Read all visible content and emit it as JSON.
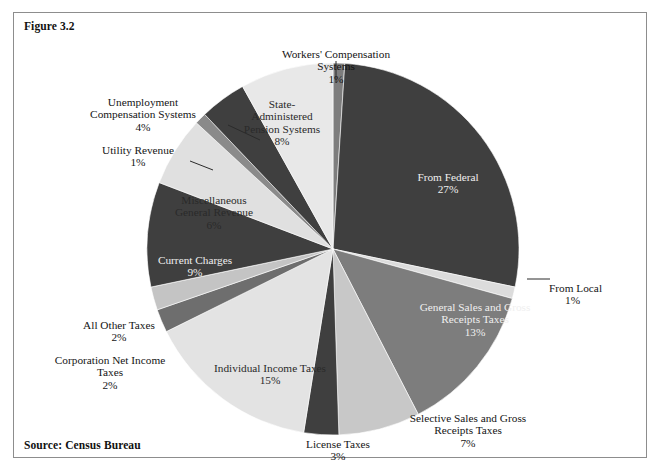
{
  "figure": {
    "caption": "Figure 3.2",
    "source": "Source: Census Bureau"
  },
  "chart_data": {
    "type": "pie",
    "title": "Figure 3.2",
    "subtitle": "",
    "xlabel": "",
    "ylabel": "",
    "grid": false,
    "legend_position": "none",
    "label_format": "name + percent",
    "start_angle_deg": 0,
    "direction": "clockwise",
    "units": "percent",
    "total_percent": 99,
    "slices": [
      {
        "label": "Workers' Compensation Systems",
        "value": 1,
        "pct_text": "1%",
        "color": "#7d7d7d"
      },
      {
        "label": "From Federal",
        "value": 27,
        "pct_text": "27%",
        "color": "#3f3f3f"
      },
      {
        "label": "From Local",
        "value": 1,
        "pct_text": "1%",
        "color": "#dcdcdc"
      },
      {
        "label": "General Sales and Gross Receipts Taxes",
        "value": 13,
        "pct_text": "13%",
        "color": "#7d7d7d"
      },
      {
        "label": "Selective Sales and Gross Receipts Taxes",
        "value": 7,
        "pct_text": "7%",
        "color": "#c8c8c8"
      },
      {
        "label": "License Taxes",
        "value": 3,
        "pct_text": "3%",
        "color": "#3f3f3f"
      },
      {
        "label": "Individual Income Taxes",
        "value": 15,
        "pct_text": "15%",
        "color": "#e3e3e3"
      },
      {
        "label": "Corporation Net Income Taxes",
        "value": 2,
        "pct_text": "2%",
        "color": "#6e6e6e"
      },
      {
        "label": "All Other Taxes",
        "value": 2,
        "pct_text": "2%",
        "color": "#c4c4c4"
      },
      {
        "label": "Current Charges",
        "value": 9,
        "pct_text": "9%",
        "color": "#3f3f3f"
      },
      {
        "label": "Miscellaneous General Revenue",
        "value": 6,
        "pct_text": "6%",
        "color": "#e0e0e0"
      },
      {
        "label": "Utility Revenue",
        "value": 1,
        "pct_text": "1%",
        "color": "#8a8a8a"
      },
      {
        "label": "Unemployment Compensation Systems",
        "value": 4,
        "pct_text": "4%",
        "color": "#3f3f3f"
      },
      {
        "label": "State-Administered Pension Systems",
        "value": 8,
        "pct_text": "8%",
        "color": "#e8e8e8"
      }
    ]
  },
  "labels": {
    "workers_comp": {
      "name": "Workers' Compensation\nSystems",
      "pct": "1%"
    },
    "from_federal": {
      "name": "From Federal",
      "pct": "27%"
    },
    "from_local": {
      "name": "From Local",
      "pct": "1%"
    },
    "general_sales": {
      "name": "General Sales and Gross\nReceipts Taxes",
      "pct": "13%"
    },
    "selective_sales": {
      "name": "Selective Sales and Gross\nReceipts Taxes",
      "pct": "7%"
    },
    "license_taxes": {
      "name": "License Taxes",
      "pct": "3%"
    },
    "individual_income": {
      "name": "Individual Income Taxes",
      "pct": "15%"
    },
    "corporation_net": {
      "name": "Corporation Net Income\nTaxes",
      "pct": "2%"
    },
    "all_other_taxes": {
      "name": "All Other Taxes",
      "pct": "2%"
    },
    "current_charges": {
      "name": "Current Charges",
      "pct": "9%"
    },
    "misc_general": {
      "name": "Miscellaneous\nGeneral Revenue",
      "pct": "6%"
    },
    "utility_revenue": {
      "name": "Utility Revenue",
      "pct": "1%"
    },
    "unemployment_comp": {
      "name": "Unemployment\nCompensation Systems",
      "pct": "4%"
    },
    "state_pension": {
      "name": "State-\nAdministered\nPension Systems",
      "pct": "8%"
    }
  },
  "colors": {
    "frame_border": "#8d8d8d",
    "page_background": "#ffffff",
    "text": "#151515",
    "label_on_dark": "#efefef"
  }
}
